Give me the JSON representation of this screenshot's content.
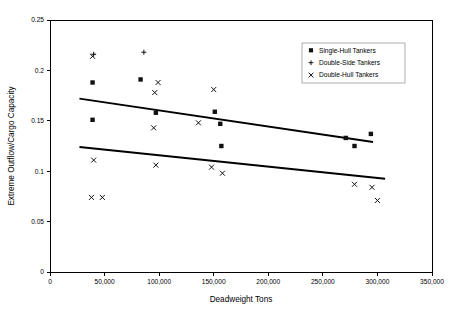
{
  "chart_data": {
    "type": "scatter",
    "title": "",
    "xlabel": "Deadweight Tons",
    "ylabel": "Extreme Outflow/Cargo Capacity",
    "xlim": [
      0,
      350000
    ],
    "ylim": [
      0,
      0.25
    ],
    "grid": false,
    "legend_position": "top-right",
    "x_ticks": [
      0,
      50000,
      100000,
      150000,
      200000,
      250000,
      300000,
      350000
    ],
    "x_tick_labels": [
      "0",
      "50,000",
      "100,000",
      "150,000",
      "200,000",
      "250,000",
      "300,000",
      "350,000"
    ],
    "y_ticks": [
      0,
      0.05,
      0.1,
      0.15,
      0.2,
      0.25
    ],
    "y_tick_labels": [
      "0",
      "0.05",
      "0.1",
      "0.15",
      "0.2",
      "0.25"
    ],
    "series": [
      {
        "name": "Single-Hull Tankers",
        "marker": "square",
        "points": [
          {
            "x": 39000,
            "y": 0.188
          },
          {
            "x": 39000,
            "y": 0.151
          },
          {
            "x": 83000,
            "y": 0.191
          },
          {
            "x": 97000,
            "y": 0.158
          },
          {
            "x": 151000,
            "y": 0.159
          },
          {
            "x": 156000,
            "y": 0.147
          },
          {
            "x": 157000,
            "y": 0.125
          },
          {
            "x": 271000,
            "y": 0.133
          },
          {
            "x": 279000,
            "y": 0.125
          },
          {
            "x": 294000,
            "y": 0.137
          }
        ]
      },
      {
        "name": "Double-Side Tankers",
        "marker": "plus",
        "points": [
          {
            "x": 40000,
            "y": 0.216
          },
          {
            "x": 86000,
            "y": 0.218
          }
        ]
      },
      {
        "name": "Double-Hull Tankers",
        "marker": "cross",
        "points": [
          {
            "x": 39000,
            "y": 0.214
          },
          {
            "x": 40000,
            "y": 0.111
          },
          {
            "x": 38000,
            "y": 0.074
          },
          {
            "x": 48000,
            "y": 0.074
          },
          {
            "x": 96000,
            "y": 0.178
          },
          {
            "x": 99000,
            "y": 0.188
          },
          {
            "x": 95000,
            "y": 0.143
          },
          {
            "x": 97000,
            "y": 0.106
          },
          {
            "x": 136000,
            "y": 0.148
          },
          {
            "x": 150000,
            "y": 0.181
          },
          {
            "x": 148000,
            "y": 0.104
          },
          {
            "x": 158000,
            "y": 0.098
          },
          {
            "x": 279000,
            "y": 0.087
          },
          {
            "x": 295000,
            "y": 0.084
          },
          {
            "x": 300000,
            "y": 0.071
          }
        ]
      }
    ],
    "trend_lines": [
      {
        "name": "upper-trend-line",
        "x1": 27000,
        "y1": 0.172,
        "x2": 296000,
        "y2": 0.129
      },
      {
        "name": "lower-trend-line",
        "x1": 27000,
        "y1": 0.124,
        "x2": 307000,
        "y2": 0.0925
      }
    ]
  },
  "legend": {
    "entries": [
      {
        "label": "Single-Hull Tankers",
        "marker": "square"
      },
      {
        "label": "Double-Side Tankers",
        "marker": "plus"
      },
      {
        "label": "Double-Hull Tankers",
        "marker": "cross"
      }
    ]
  },
  "colors": {
    "marker": "#111111",
    "axis": "#000000",
    "legend_border": "#9a9a9a",
    "background": "#ffffff"
  }
}
